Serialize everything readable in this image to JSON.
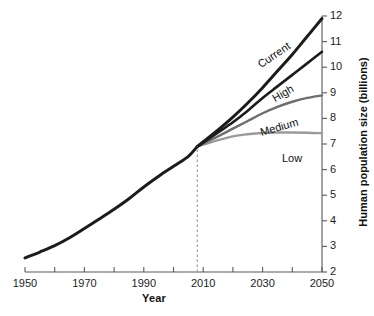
{
  "chart_data": {
    "type": "line",
    "title": "",
    "xlabel": "Year",
    "ylabel": "Human population size (billions)",
    "xlim": [
      1950,
      2050
    ],
    "ylim": [
      2,
      12
    ],
    "xticks": [
      1950,
      1960,
      1970,
      1980,
      1990,
      2000,
      2010,
      2020,
      2030,
      2040,
      2050
    ],
    "xtick_labels": [
      "1950",
      "",
      "1970",
      "",
      "1990",
      "",
      "2010",
      "",
      "2030",
      "",
      "2050"
    ],
    "yticks": [
      2,
      3,
      4,
      5,
      6,
      7,
      8,
      9,
      10,
      11,
      12
    ],
    "ytick_labels": [
      "2",
      "3",
      "4",
      "5",
      "6",
      "7",
      "8",
      "9",
      "10",
      "11",
      "12"
    ],
    "grid": false,
    "legend_position": "inline-curve-labels",
    "y_axis_side": "right",
    "branch_year": 2008,
    "branch_value": 6.9,
    "annotations": [
      {
        "name": "projection-divider",
        "type": "vertical-dashed-line",
        "x": 2008,
        "y_from": 2,
        "y_to": 6.9
      }
    ],
    "series": [
      {
        "name": "Historical",
        "label": "",
        "color": "#1c1c1c",
        "width": 3.0,
        "x": [
          1950,
          1955,
          1960,
          1965,
          1970,
          1975,
          1980,
          1985,
          1990,
          1995,
          2000,
          2005,
          2008
        ],
        "values": [
          2.55,
          2.78,
          3.03,
          3.34,
          3.7,
          4.07,
          4.45,
          4.86,
          5.32,
          5.74,
          6.13,
          6.52,
          6.9
        ]
      },
      {
        "name": "Current",
        "label": "Current",
        "color": "#1c1c1c",
        "width": 3.0,
        "x": [
          2008,
          2015,
          2020,
          2025,
          2030,
          2035,
          2040,
          2045,
          2050
        ],
        "values": [
          6.9,
          7.55,
          8.05,
          8.6,
          9.2,
          9.85,
          10.5,
          11.2,
          11.9
        ]
      },
      {
        "name": "High",
        "label": "High",
        "color": "#1c1c1c",
        "width": 2.6,
        "x": [
          2008,
          2015,
          2020,
          2025,
          2030,
          2035,
          2040,
          2045,
          2050
        ],
        "values": [
          6.9,
          7.45,
          7.85,
          8.3,
          8.8,
          9.25,
          9.7,
          10.15,
          10.6
        ]
      },
      {
        "name": "Medium",
        "label": "Medium",
        "color": "#6e6e6e",
        "width": 2.4,
        "x": [
          2008,
          2015,
          2020,
          2025,
          2030,
          2035,
          2040,
          2045,
          2050
        ],
        "values": [
          6.9,
          7.3,
          7.6,
          7.9,
          8.2,
          8.45,
          8.65,
          8.8,
          8.9
        ]
      },
      {
        "name": "Low",
        "label": "Low",
        "color": "#9a9a9a",
        "width": 2.4,
        "x": [
          2008,
          2015,
          2020,
          2025,
          2030,
          2035,
          2040,
          2045,
          2050
        ],
        "values": [
          6.9,
          7.15,
          7.3,
          7.38,
          7.43,
          7.45,
          7.45,
          7.44,
          7.42
        ]
      }
    ],
    "series_label_placement": [
      {
        "name": "Current",
        "x_px": 262,
        "y_px": 58,
        "rotation": -34
      },
      {
        "name": "High",
        "x_px": 276,
        "y_px": 92,
        "rotation": -30
      },
      {
        "name": "Medium",
        "x_px": 262,
        "y_px": 126,
        "rotation": -16
      },
      {
        "name": "Low",
        "x_px": 282,
        "y_px": 152,
        "rotation": 0
      }
    ],
    "colors": {
      "axis": "#5a5a5a",
      "text": "#1c1c1c",
      "background": "#ffffff",
      "historical": "#1c1c1c",
      "current": "#1c1c1c",
      "high": "#1c1c1c",
      "medium": "#6e6e6e",
      "low": "#9a9a9a",
      "divider": "#8a8a8a"
    }
  }
}
